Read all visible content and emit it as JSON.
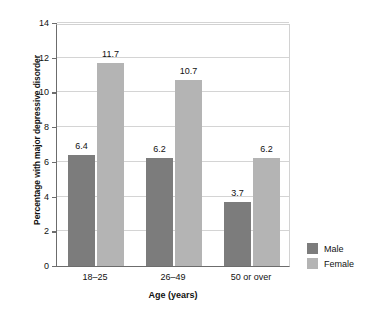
{
  "chart_data": {
    "type": "bar",
    "title": "",
    "xlabel": "Age (years)",
    "ylabel": "Percentage with major depressive disorder",
    "categories": [
      "18–25",
      "26–49",
      "50 or over"
    ],
    "series": [
      {
        "name": "Male",
        "values": [
          6.4,
          6.2,
          3.7
        ],
        "color": "#7c7c7c"
      },
      {
        "name": "Female",
        "values": [
          11.7,
          10.7,
          6.2
        ],
        "color": "#b4b4b4"
      }
    ],
    "ylim": [
      0,
      14
    ],
    "yticks": [
      0,
      2,
      4,
      6,
      8,
      10,
      12,
      14
    ],
    "ytick_labels": [
      "0",
      "2",
      "4",
      "6",
      "8",
      "10",
      "12",
      "14"
    ],
    "grid": true,
    "legend_position": "right",
    "data_labels": [
      "6.4",
      "11.7",
      "6.2",
      "10.7",
      "3.7",
      "6.2"
    ]
  },
  "legend": {
    "items": [
      {
        "label": "Male",
        "color": "#7c7c7c"
      },
      {
        "label": "Female",
        "color": "#b4b4b4"
      }
    ]
  }
}
